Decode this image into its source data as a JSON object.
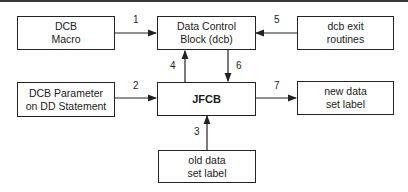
{
  "diagram": {
    "boxes": [
      {
        "id": "dcb-macro",
        "lines": [
          "DCB",
          "Macro"
        ]
      },
      {
        "id": "data-control-block",
        "lines": [
          "Data Control",
          "Block (dcb)"
        ]
      },
      {
        "id": "dcb-exit-routines",
        "lines": [
          "dcb exit",
          "routines"
        ]
      },
      {
        "id": "dcb-parameter",
        "lines": [
          "DCB Parameter",
          "on DD  Statement"
        ]
      },
      {
        "id": "jfcb",
        "lines": [
          "JFCB"
        ]
      },
      {
        "id": "new-data-set-label",
        "lines": [
          "new data",
          "set label"
        ]
      },
      {
        "id": "old-data-set-label",
        "lines": [
          "old data",
          "set label"
        ]
      }
    ],
    "arrows": [
      {
        "label": "1",
        "from": "dcb-macro",
        "to": "data-control-block"
      },
      {
        "label": "2",
        "from": "dcb-parameter",
        "to": "jfcb"
      },
      {
        "label": "3",
        "from": "old-data-set-label",
        "to": "jfcb"
      },
      {
        "label": "4",
        "from": "jfcb",
        "to": "data-control-block"
      },
      {
        "label": "5",
        "from": "dcb-exit-routines",
        "to": "data-control-block"
      },
      {
        "label": "6",
        "from": "data-control-block",
        "to": "jfcb"
      },
      {
        "label": "7",
        "from": "jfcb",
        "to": "new-data-set-label"
      }
    ]
  }
}
